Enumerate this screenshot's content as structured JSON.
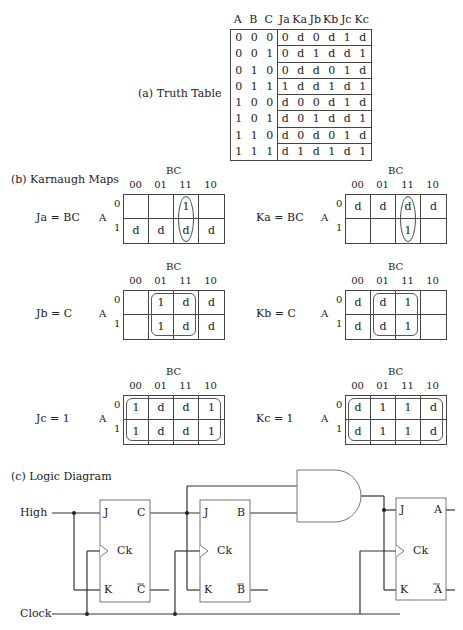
{
  "truth_table": {
    "caption": "(a) Truth Table",
    "headers": [
      "A",
      "B",
      "C",
      "Ja",
      "Ka",
      "Jb",
      "Kb",
      "Jc",
      "Kc"
    ],
    "rows": [
      [
        "0",
        "0",
        "0",
        "0",
        "d",
        "0",
        "d",
        "1",
        "d"
      ],
      [
        "0",
        "0",
        "1",
        "0",
        "d",
        "1",
        "d",
        "d",
        "1"
      ],
      [
        "0",
        "1",
        "0",
        "0",
        "d",
        "d",
        "0",
        "1",
        "d"
      ],
      [
        "0",
        "1",
        "1",
        "1",
        "d",
        "d",
        "1",
        "d",
        "1"
      ],
      [
        "1",
        "0",
        "0",
        "d",
        "0",
        "0",
        "d",
        "1",
        "d"
      ],
      [
        "1",
        "0",
        "1",
        "d",
        "0",
        "1",
        "d",
        "d",
        "1"
      ],
      [
        "1",
        "1",
        "0",
        "d",
        "0",
        "d",
        "0",
        "1",
        "d"
      ],
      [
        "1",
        "1",
        "1",
        "d",
        "1",
        "d",
        "1",
        "d",
        "1"
      ]
    ]
  },
  "kmaps": {
    "caption": "(b) Karnaugh Maps",
    "col_var": "BC",
    "row_var": "A",
    "col_labels": [
      "00",
      "01",
      "11",
      "10"
    ],
    "row_labels": [
      "0",
      "1"
    ],
    "maps": [
      {
        "eq": "Ja = BC",
        "cells": [
          [
            "",
            "",
            "1",
            ""
          ],
          [
            "d",
            "d",
            "d",
            "d"
          ]
        ]
      },
      {
        "eq": "Ka = BC",
        "cells": [
          [
            "d",
            "d",
            "d",
            "d"
          ],
          [
            "",
            "",
            "1",
            ""
          ]
        ]
      },
      {
        "eq": "Jb = C",
        "cells": [
          [
            "",
            "1",
            "d",
            "d"
          ],
          [
            "",
            "1",
            "d",
            "d"
          ]
        ]
      },
      {
        "eq": "Kb = C",
        "cells": [
          [
            "d",
            "d",
            "1",
            ""
          ],
          [
            "d",
            "d",
            "1",
            ""
          ]
        ]
      },
      {
        "eq": "Jc = 1",
        "cells": [
          [
            "1",
            "d",
            "d",
            "1"
          ],
          [
            "1",
            "d",
            "d",
            "1"
          ]
        ]
      },
      {
        "eq": "Kc = 1",
        "cells": [
          [
            "d",
            "1",
            "1",
            "d"
          ],
          [
            "d",
            "1",
            "1",
            "d"
          ]
        ]
      }
    ]
  },
  "logic": {
    "caption": "(c) Logic Diagram",
    "inputs": {
      "high": "High",
      "clock": "Clock"
    },
    "flipflops": [
      {
        "j": "J",
        "k": "K",
        "ck": "Ck",
        "q": "C",
        "qbar": "C"
      },
      {
        "j": "J",
        "k": "K",
        "ck": "Ck",
        "q": "B",
        "qbar": "B"
      },
      {
        "j": "J",
        "k": "K",
        "ck": "Ck",
        "q": "A",
        "qbar": "A"
      }
    ],
    "gate": "AND"
  }
}
